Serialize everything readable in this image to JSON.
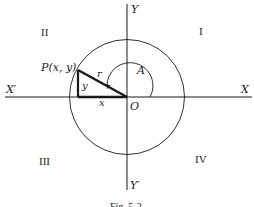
{
  "figure": {
    "caption": "Fig. 5-2",
    "colors": {
      "ink": "#1a1a1a",
      "background": "#ffffff"
    }
  },
  "axes": {
    "x_positive_label": "X",
    "x_negative_label": "X′",
    "y_positive_label": "Y",
    "y_negative_label": "Y′",
    "origin_label": "O"
  },
  "quadrants": {
    "q1": "I",
    "q2": "II",
    "q3": "III",
    "q4": "IV"
  },
  "triangle": {
    "point_label": "P(x, y)",
    "hypotenuse_label": "r",
    "vertical_leg_label": "y",
    "horizontal_leg_label": "x"
  },
  "angle": {
    "label": "A"
  }
}
